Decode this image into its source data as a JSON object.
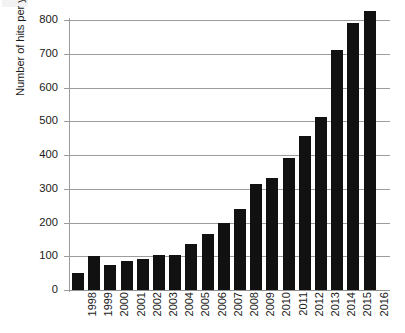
{
  "chart_data": {
    "type": "bar",
    "title": "",
    "subtitle": "",
    "xlabel": "",
    "ylabel": "Number of hits per year",
    "ylim": [
      0,
      800
    ],
    "ytick_step": 100,
    "yticks": [
      0,
      100,
      200,
      300,
      400,
      500,
      600,
      700,
      800
    ],
    "ytick_labels": [
      "0",
      "100",
      "200",
      "300",
      "400",
      "500",
      "600",
      "700",
      "800"
    ],
    "grid": true,
    "grid_axis": "y",
    "legend": false,
    "legend_position": "none",
    "bar_color": "#111111",
    "grid_color": "#9c9c9c",
    "axis_color": "#9c9c9c",
    "orientation": "vertical",
    "xtick_rotation": 90,
    "categories": [
      "1998",
      "1999",
      "2000",
      "2001",
      "2002",
      "2003",
      "2004",
      "2005",
      "2006",
      "2007",
      "2008",
      "2009",
      "2010",
      "2011",
      "2012",
      "2013",
      "2014",
      "2015",
      "2016"
    ],
    "values": [
      50,
      100,
      75,
      87,
      92,
      104,
      103,
      137,
      167,
      200,
      240,
      315,
      331,
      390,
      455,
      512,
      710,
      790,
      828
    ],
    "points": [
      {
        "x": "1998",
        "y": 50
      },
      {
        "x": "1999",
        "y": 100
      },
      {
        "x": "2000",
        "y": 75
      },
      {
        "x": "2001",
        "y": 87
      },
      {
        "x": "2002",
        "y": 92
      },
      {
        "x": "2003",
        "y": 104
      },
      {
        "x": "2004",
        "y": 103
      },
      {
        "x": "2005",
        "y": 137
      },
      {
        "x": "2006",
        "y": 167
      },
      {
        "x": "2007",
        "y": 200
      },
      {
        "x": "2008",
        "y": 240
      },
      {
        "x": "2009",
        "y": 315
      },
      {
        "x": "2010",
        "y": 331
      },
      {
        "x": "2011",
        "y": 390
      },
      {
        "x": "2012",
        "y": 455
      },
      {
        "x": "2013",
        "y": 512
      },
      {
        "x": "2014",
        "y": 710
      },
      {
        "x": "2015",
        "y": 790
      },
      {
        "x": "2016",
        "y": 828
      }
    ]
  }
}
